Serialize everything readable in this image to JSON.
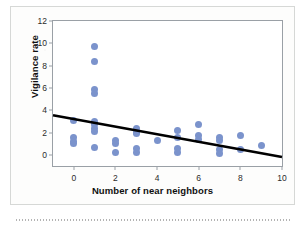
{
  "chart_data": {
    "type": "scatter",
    "title": "",
    "xlabel": "Number of near neighbors",
    "ylabel": "Vigilance rate",
    "xlim": [
      -1,
      10
    ],
    "ylim": [
      -1,
      12
    ],
    "xticks": [
      0,
      2,
      4,
      6,
      8,
      10
    ],
    "yticks": [
      0,
      2,
      4,
      6,
      8,
      10,
      12
    ],
    "grid": false,
    "legend": null,
    "points": [
      {
        "x": 0,
        "y": 3.1
      },
      {
        "x": 0,
        "y": 1.6
      },
      {
        "x": 0,
        "y": 1.2
      },
      {
        "x": 0,
        "y": 1.0
      },
      {
        "x": 1,
        "y": 9.7
      },
      {
        "x": 1,
        "y": 8.4
      },
      {
        "x": 1,
        "y": 5.9
      },
      {
        "x": 1,
        "y": 5.5
      },
      {
        "x": 1,
        "y": 3.0
      },
      {
        "x": 1,
        "y": 2.7
      },
      {
        "x": 1,
        "y": 2.4
      },
      {
        "x": 1,
        "y": 2.1
      },
      {
        "x": 1,
        "y": 0.7
      },
      {
        "x": 2,
        "y": 1.3
      },
      {
        "x": 2,
        "y": 1.0
      },
      {
        "x": 2,
        "y": 0.2
      },
      {
        "x": 3,
        "y": 2.4
      },
      {
        "x": 3,
        "y": 2.0
      },
      {
        "x": 3,
        "y": 1.9
      },
      {
        "x": 3,
        "y": 0.6
      },
      {
        "x": 3,
        "y": 0.2
      },
      {
        "x": 4,
        "y": 1.3
      },
      {
        "x": 5,
        "y": 2.2
      },
      {
        "x": 5,
        "y": 1.6
      },
      {
        "x": 5,
        "y": 0.6
      },
      {
        "x": 5,
        "y": 0.2
      },
      {
        "x": 6,
        "y": 2.7
      },
      {
        "x": 6,
        "y": 1.7
      },
      {
        "x": 6,
        "y": 1.4
      },
      {
        "x": 7,
        "y": 1.6
      },
      {
        "x": 7,
        "y": 1.3
      },
      {
        "x": 7,
        "y": 0.5
      },
      {
        "x": 7,
        "y": 0.1
      },
      {
        "x": 8,
        "y": 1.7
      },
      {
        "x": 8,
        "y": 0.5
      },
      {
        "x": 9,
        "y": 0.8
      }
    ],
    "trendline": {
      "x_start": -1,
      "y_start": 3.55,
      "x_end": 10,
      "y_end": -0.2,
      "color": "#000000"
    },
    "point_color": "#7b93cc"
  }
}
